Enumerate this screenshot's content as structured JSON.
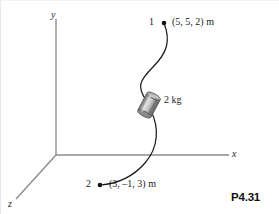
{
  "figure": {
    "number": "P4.31",
    "axes": {
      "y_label": "y",
      "x_label": "x",
      "z_label": "z"
    },
    "points": [
      {
        "id": "1",
        "label": "1",
        "coordinates": "(5, 5, 2) m",
        "values": [
          5,
          5,
          2
        ],
        "units": "m"
      },
      {
        "id": "2",
        "label": "2",
        "coordinates": "(3, –1, 3) m",
        "values": [
          3,
          -1,
          3
        ],
        "units": "m"
      }
    ],
    "mass": {
      "label": "2 kg",
      "value": 2,
      "units": "kg"
    },
    "colors": {
      "axis": "#8c8c8c",
      "curve": "#1a1a1a",
      "collar_light": "#d8d8d8",
      "collar_mid": "#9a9a9a",
      "collar_dark": "#5e5e5e",
      "text": "#1a1a1a"
    }
  }
}
